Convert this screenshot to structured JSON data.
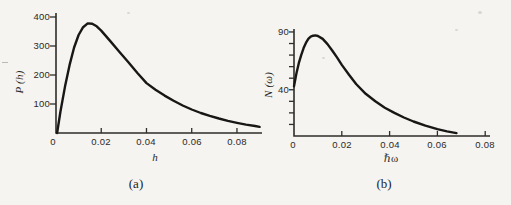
{
  "figure": {
    "background_color": "#f5f4f1",
    "ink_color": "#181715",
    "axis_color": "#2f2d2a"
  },
  "chart_data": [
    {
      "id": "a",
      "type": "line",
      "caption": "(a)",
      "xlabel": "h",
      "ylabel": "P (h)",
      "xlim": [
        0,
        0.091
      ],
      "ylim": [
        0,
        400
      ],
      "grid": false,
      "legend": null,
      "x_ticks": [
        0,
        0.02,
        0.04,
        0.06,
        0.08
      ],
      "x_tick_labels": [
        "0",
        "0.02",
        "0.04",
        "0.06",
        "0.08"
      ],
      "y_ticks": [
        100,
        200,
        300,
        400
      ],
      "y_tick_labels": [
        "100",
        "200",
        "300",
        "400"
      ],
      "peak": {
        "x": 0.014,
        "y": 380
      },
      "curve": {
        "x": [
          0.0005,
          0.002,
          0.004,
          0.006,
          0.008,
          0.01,
          0.012,
          0.014,
          0.016,
          0.018,
          0.02,
          0.024,
          0.028,
          0.032,
          0.036,
          0.04,
          0.044,
          0.048,
          0.052,
          0.056,
          0.06,
          0.064,
          0.068,
          0.072,
          0.076,
          0.08,
          0.084,
          0.088,
          0.09
        ],
        "y": [
          0,
          75,
          160,
          235,
          295,
          338,
          365,
          378,
          377,
          368,
          353,
          317,
          280,
          244,
          207,
          172,
          149,
          129,
          111,
          95,
          81,
          69,
          59,
          50,
          42,
          35,
          29,
          24,
          21
        ]
      }
    },
    {
      "id": "b",
      "type": "line",
      "caption": "(b)",
      "xlabel": "ℏω",
      "ylabel": "N (ω)",
      "xlim": [
        0,
        0.068
      ],
      "ylim": [
        0,
        90
      ],
      "grid": false,
      "legend": null,
      "x_ticks": [
        0,
        0.02,
        0.04,
        0.06,
        0.08
      ],
      "x_tick_labels": [
        "0",
        "0.02",
        "0.04",
        "0.06",
        "0.08"
      ],
      "y_ticks": [
        10,
        20,
        30,
        40,
        50,
        60,
        70,
        80,
        90
      ],
      "y_tick_labels": [
        "",
        "",
        "",
        "40",
        "",
        "",
        "",
        "",
        "90"
      ],
      "peak": {
        "x": 0.009,
        "y": 87
      },
      "curve": {
        "x": [
          0,
          0.001,
          0.002,
          0.003,
          0.004,
          0.005,
          0.006,
          0.007,
          0.008,
          0.009,
          0.01,
          0.012,
          0.014,
          0.016,
          0.018,
          0.02,
          0.023,
          0.026,
          0.03,
          0.034,
          0.038,
          0.042,
          0.046,
          0.05,
          0.055,
          0.06,
          0.064,
          0.068
        ],
        "y": [
          43,
          54,
          63,
          70,
          76,
          80.5,
          84,
          86,
          86.8,
          87,
          86.5,
          84,
          79.5,
          74,
          68,
          61.5,
          53,
          45,
          36.5,
          30,
          24.5,
          20,
          16,
          12.5,
          9,
          6,
          4,
          2.5
        ]
      }
    }
  ]
}
